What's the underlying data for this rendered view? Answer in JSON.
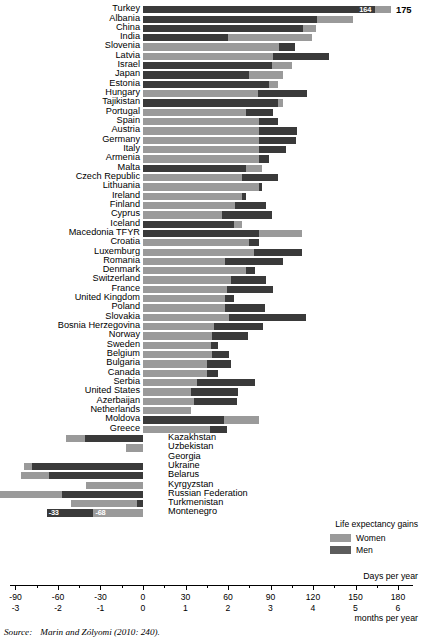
{
  "legend": {
    "title": "Life expectancy gains",
    "items": [
      {
        "label": "Women",
        "color": "#9a9a9a",
        "key": "women"
      },
      {
        "label": "Men",
        "color": "#5c5c5c",
        "key": "men"
      }
    ]
  },
  "axis": {
    "units_primary": "Days per year",
    "units_secondary": "months per year",
    "ticks_days": [
      "-90",
      "-60",
      "-30",
      "0",
      "30",
      "60",
      "90",
      "120",
      "150",
      "180"
    ],
    "ticks_months": [
      "-3",
      "-2",
      "-1",
      "0",
      "1",
      "2",
      "3",
      "4",
      "5",
      "6"
    ],
    "min": -90,
    "max": 180,
    "step": 30
  },
  "source": {
    "label": "Source:",
    "text": "Marin and Zólyomi (2010: 240)."
  },
  "chart_data": {
    "type": "bar",
    "orientation": "horizontal",
    "stacked": true,
    "title": "",
    "xlabel": "Days per year",
    "ylabel": "",
    "xlim": [
      -90,
      180
    ],
    "grid": false,
    "legend_position": "bottom-right",
    "series": [
      {
        "name": "Women",
        "color": "#9a9a9a"
      },
      {
        "name": "Men",
        "color": "#3a3a3a"
      }
    ],
    "note": "Each row is a stacked bar; 'men' and 'women' are the two segment lengths in days per year; 'order' gives which segment is drawn first from the axis origin.",
    "rows": [
      {
        "country": "Turkey",
        "men": 164,
        "women": 11,
        "order": "men",
        "labels": {
          "men": "164",
          "women_outside": "175"
        }
      },
      {
        "country": "Albania",
        "men": 123,
        "women": 25,
        "order": "men"
      },
      {
        "country": "China",
        "men": 113,
        "women": 9,
        "order": "men"
      },
      {
        "country": "India",
        "men": 60,
        "women": 59,
        "order": "men"
      },
      {
        "country": "Slovenia",
        "men": 11,
        "women": 96,
        "order": "women"
      },
      {
        "country": "Latvia",
        "men": 39,
        "women": 92,
        "order": "women"
      },
      {
        "country": "Israel",
        "men": 91,
        "women": 14,
        "order": "men"
      },
      {
        "country": "Japan",
        "men": 75,
        "women": 24,
        "order": "men"
      },
      {
        "country": "Estonia",
        "men": 89,
        "women": 6,
        "order": "men"
      },
      {
        "country": "Hungary",
        "men": 35,
        "women": 81,
        "order": "women"
      },
      {
        "country": "Tajikistan",
        "men": 95,
        "women": 4,
        "order": "men"
      },
      {
        "country": "Portugal",
        "men": 19,
        "women": 73,
        "order": "women"
      },
      {
        "country": "Spain",
        "men": 13,
        "women": 82,
        "order": "women"
      },
      {
        "country": "Austria",
        "men": 27,
        "women": 82,
        "order": "women"
      },
      {
        "country": "Germany",
        "men": 26,
        "women": 82,
        "order": "women"
      },
      {
        "country": "Italy",
        "men": 19,
        "women": 82,
        "order": "women"
      },
      {
        "country": "Armenia",
        "men": 7,
        "women": 82,
        "order": "women"
      },
      {
        "country": "Malta",
        "men": 73,
        "women": 11,
        "order": "men"
      },
      {
        "country": "Czech Republic",
        "men": 25,
        "women": 70,
        "order": "women"
      },
      {
        "country": "Lithuania",
        "men": 2,
        "women": 82,
        "order": "women"
      },
      {
        "country": "Ireland",
        "men": 3,
        "women": 70,
        "order": "women"
      },
      {
        "country": "Finland",
        "men": 22,
        "women": 65,
        "order": "women"
      },
      {
        "country": "Cyprus",
        "men": 35,
        "women": 56,
        "order": "women"
      },
      {
        "country": "Iceland",
        "men": 64,
        "women": 6,
        "order": "men"
      },
      {
        "country": "Macedonia TFYR",
        "men": 82,
        "women": 30,
        "order": "men"
      },
      {
        "country": "Croatia",
        "men": 7,
        "women": 75,
        "order": "women"
      },
      {
        "country": "Luxemburg",
        "men": 34,
        "women": 78,
        "order": "women"
      },
      {
        "country": "Romania",
        "men": 41,
        "women": 58,
        "order": "women"
      },
      {
        "country": "Denmark",
        "men": 6,
        "women": 73,
        "order": "women"
      },
      {
        "country": "Switzerland",
        "men": 25,
        "women": 62,
        "order": "women"
      },
      {
        "country": "France",
        "men": 33,
        "women": 59,
        "order": "women"
      },
      {
        "country": "United Kingdom",
        "men": 6,
        "women": 58,
        "order": "women"
      },
      {
        "country": "Poland",
        "men": 28,
        "women": 58,
        "order": "women"
      },
      {
        "country": "Slovakia",
        "men": 54,
        "women": 61,
        "order": "women"
      },
      {
        "country": "Bosnia Herzegovina",
        "men": 35,
        "women": 50,
        "order": "women"
      },
      {
        "country": "Norway",
        "men": 25,
        "women": 49,
        "order": "women"
      },
      {
        "country": "Sweden",
        "men": 5,
        "women": 48,
        "order": "women"
      },
      {
        "country": "Belgium",
        "men": 12,
        "women": 49,
        "order": "women"
      },
      {
        "country": "Bulgaria",
        "men": 17,
        "women": 45,
        "order": "women"
      },
      {
        "country": "Canada",
        "men": 8,
        "women": 45,
        "order": "women"
      },
      {
        "country": "Serbia",
        "men": 41,
        "women": 38,
        "order": "women"
      },
      {
        "country": "United States",
        "men": 33,
        "women": 34,
        "order": "women"
      },
      {
        "country": "Azerbaijan",
        "men": 30,
        "women": 36,
        "order": "women"
      },
      {
        "country": "Netherlands",
        "men": 0,
        "women": 34,
        "order": "women"
      },
      {
        "country": "Moldova",
        "men": 57,
        "women": 25,
        "order": "men"
      },
      {
        "country": "Greece",
        "men": 12,
        "women": 47,
        "order": "women"
      },
      {
        "country": "Kazakhstan",
        "men": -41,
        "women": -13,
        "order": "men",
        "label_side": "right"
      },
      {
        "country": "Uzbekistan",
        "men": 0,
        "women": -12,
        "order": "women",
        "label_side": "right"
      },
      {
        "country": "Georgia",
        "men": 0,
        "women": 0,
        "order": "women",
        "label_side": "right"
      },
      {
        "country": "Ukraine",
        "men": -78,
        "women": -6,
        "order": "men",
        "label_side": "right"
      },
      {
        "country": "Belarus",
        "men": -66,
        "women": -20,
        "order": "men",
        "label_side": "right"
      },
      {
        "country": "Kyrgyzstan",
        "men": 0,
        "women": -40,
        "order": "women",
        "label_side": "right"
      },
      {
        "country": "Russian Federation",
        "men": -57,
        "women": -46,
        "order": "men",
        "label_side": "right"
      },
      {
        "country": "Turkmenistan",
        "men": -4,
        "women": -47,
        "order": "men",
        "label_side": "right"
      },
      {
        "country": "Montenegro",
        "men": -33,
        "women": -35,
        "order": "women",
        "label_side": "right",
        "labels": {
          "women": "-68",
          "men": "-33"
        }
      }
    ]
  }
}
